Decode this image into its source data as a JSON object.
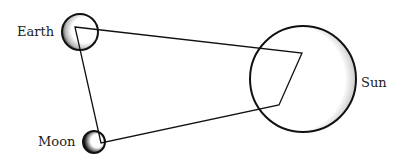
{
  "diagram": {
    "type": "astronomy-quadrilateral",
    "labels": {
      "earth": "Earth",
      "moon": "Moon",
      "sun": "Sun"
    },
    "bodies": {
      "earth": {
        "cx": 80,
        "cy": 32,
        "r": 18
      },
      "moon": {
        "cx": 94,
        "cy": 142,
        "r": 11
      },
      "sun": {
        "cx": 303,
        "cy": 79,
        "r": 53
      }
    },
    "quadrilateral": [
      [
        75,
        27
      ],
      [
        302,
        53
      ],
      [
        279,
        105
      ],
      [
        101,
        143
      ]
    ],
    "colors": {
      "stroke": "#111111",
      "background": "#ffffff"
    }
  }
}
